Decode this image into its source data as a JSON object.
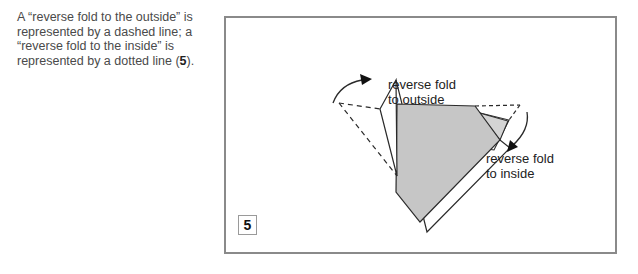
{
  "caption": {
    "part1": "A “reverse fold to the outside” is represented by a dashed line; a “reverse fold to the inside” is represented by a dotted line (",
    "step_ref": "5",
    "part2": ")."
  },
  "diagram": {
    "step_number": "5",
    "label_outside_line1": "reverse fold",
    "label_outside_line2": "to outside",
    "label_inside_line1": "reverse fold",
    "label_inside_line2": "to inside",
    "colors": {
      "fill_gray": "#c6c6c6",
      "line": "#2a2a2a",
      "frame": "#8a8a8a"
    }
  }
}
